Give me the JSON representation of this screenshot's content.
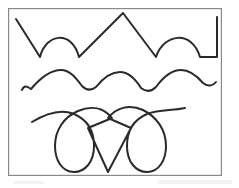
{
  "figure": {
    "caption": "",
    "medium": "pen on white paper, scanned",
    "canvas": {
      "width": 239,
      "height": 188,
      "background_color": "#ffffff"
    },
    "frame": {
      "name": "rectangular-border",
      "x": 8,
      "y": 8,
      "width": 214,
      "height": 168,
      "stroke_color": "#8a8a8a",
      "stroke_width": 1.2,
      "fill": "#ffffff"
    },
    "ink_color": "#2a2a2a",
    "stroke_width": 2.0,
    "rows": [
      {
        "index": 1,
        "name": "zigzag-and-arch-row",
        "description": "Alternating straight diagonal strokes and rounded arches: down-stroke, arch, up-stroke to sharp peak, down-stroke, arch, short vertical end stroke",
        "segment_count": 6,
        "path": "M 16 19 L 40 57 C 46 33 72 30 79 57 L 123 13 L 156 57 C 164 33 192 30 200 57 L 217 57 L 217 17",
        "baseline_y": 57,
        "peak_y": 13
      },
      {
        "index": 2,
        "name": "smooth-wave-row",
        "description": "Continuous smooth sinusoidal wave with three rounded humps and rounded troughs",
        "hump_count": 3,
        "path": "M 22 90 C 24 85 27 86 31 89 C 42 76 52 70 61 70 C 70 70 76 78 82 86 C 86 90 91 91 96 87 C 104 77 112 72 120 72 C 129 72 136 80 141 88 C 146 92 151 92 156 87 C 164 76 172 70 181 70 C 190 70 197 76 203 83 C 208 87 213 86 216 82",
        "baseline_y": 89,
        "crest_y": 70
      },
      {
        "index": 3,
        "name": "loops-and-diamond-row",
        "description": "Cursive-style row: long arc into a tall narrow descending loop, rising to a sharp diamond point, second arc into a mirrored loop, exiting as an arc to the right",
        "loop_count": 2,
        "diamond_point_y": 172,
        "path": "M 32 122 C 48 112 62 109 74 114 C 88 120 94 132 94 146 C 94 162 85 172 74 172 C 62 172 55 160 55 146 C 55 130 64 117 78 111 C 92 105 104 108 112 118 L 88 128 L 108 172 L 131 128 L 108 118 C 117 107 130 104 143 110 C 157 117 166 130 166 146 C 166 160 159 172 147 172 C 136 172 127 162 127 146 C 127 132 133 120 147 114 C 160 109 172 111 185 108"
      }
    ],
    "scan_artifacts": [
      {
        "name": "scan-smudge-bottom-right",
        "x": 158,
        "y": 180,
        "width": 74,
        "height": 4
      },
      {
        "name": "scan-smudge-bottom-left",
        "x": 14,
        "y": 181,
        "width": 30,
        "height": 3
      }
    ]
  }
}
